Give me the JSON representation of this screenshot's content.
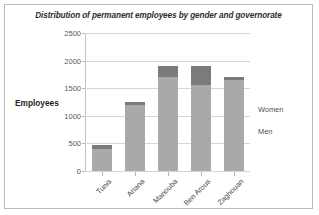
{
  "chart_data": {
    "type": "bar",
    "subtype": "stacked-column",
    "title": "Distribution of permanent employees by gender and governorate",
    "xlabel": "",
    "ylabel": "Employees",
    "ylim": [
      0,
      2500
    ],
    "ytick_step": 500,
    "yticks": [
      2500,
      2000,
      1500,
      1000,
      500,
      0
    ],
    "grid": true,
    "legend_position": "right",
    "categories": [
      "Tunis",
      "Ariana",
      "Manouba",
      "Ben Arous",
      "Zaghouan"
    ],
    "series": [
      {
        "name": "Men",
        "color": "#a9a9a9",
        "values": [
          400,
          1200,
          1710,
          1560,
          1640
        ]
      },
      {
        "name": "Women",
        "color": "#7b7b7b",
        "values": [
          70,
          55,
          200,
          350,
          70
        ]
      }
    ],
    "totals": [
      470,
      1255,
      1910,
      1910,
      1710
    ]
  },
  "legend": {
    "women_label": "Women",
    "men_label": "Men"
  },
  "colors": {
    "men": "#a9a9a9",
    "women": "#7b7b7b",
    "grid": "#d6d6d6",
    "border": "#b9b9b9",
    "text": "#4a4a4a"
  }
}
